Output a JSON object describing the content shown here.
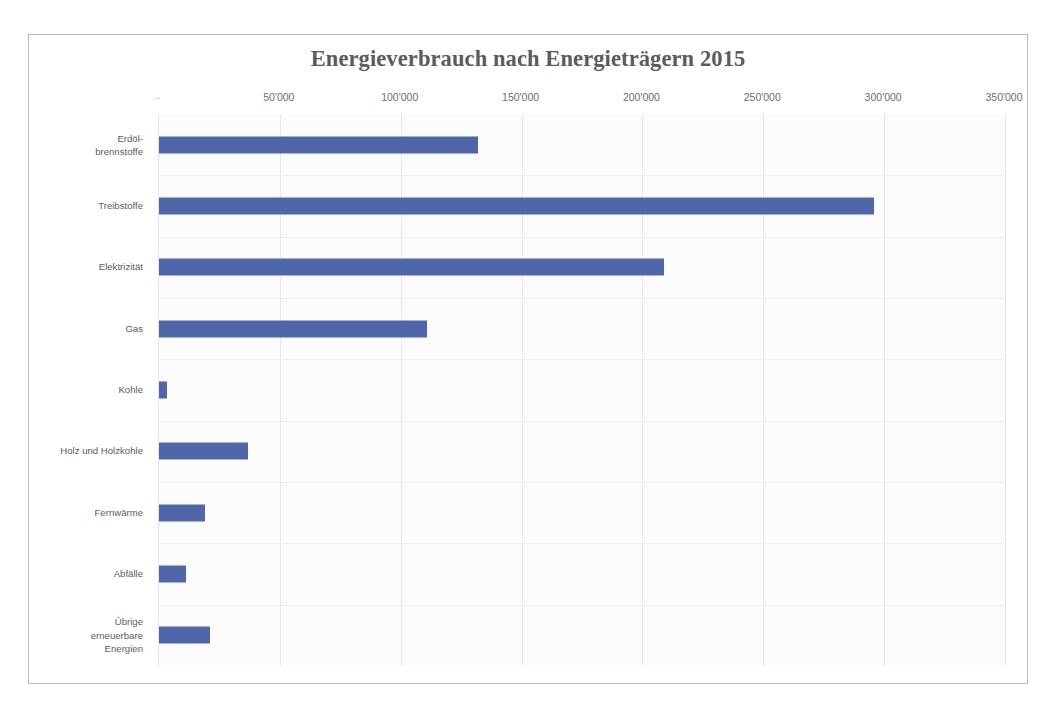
{
  "page": {
    "top_cut_text": "",
    "frame_border_color": "#b9b9b9"
  },
  "chart_data": {
    "type": "bar",
    "orientation": "horizontal",
    "title": "Energieverbrauch nach Energieträgern 2015",
    "xlabel": "",
    "ylabel": "",
    "xlim": [
      0,
      350000
    ],
    "xticks": [
      0,
      50000,
      100000,
      150000,
      200000,
      250000,
      300000,
      350000
    ],
    "xticklabels": [
      "-",
      "50'000",
      "100'000",
      "150'000",
      "200'000",
      "250'000",
      "300'000",
      "350'000"
    ],
    "grid": true,
    "legend": null,
    "bar_color": "#4f66a8",
    "title_color": "#5b5b5b",
    "label_color": "#5d5d5d",
    "gridline_color": "#e6e8ee",
    "plot_background": "#fcfcfd",
    "categories": [
      "Erdöl-\nbrennstoffe",
      "Treibstoffe",
      "Elektrizität",
      "Gas",
      "Kohle",
      "Holz und Holzkohle",
      "Fernwärme",
      "Abfälle",
      "Übrige\nerneuerbare\nEnergien"
    ],
    "values": [
      132000,
      296000,
      209000,
      111000,
      3500,
      37000,
      19000,
      11000,
      21000
    ],
    "points": [
      {
        "label": "Erdöl-brennstoffe",
        "label_lines": [
          "Erdöl-",
          "brennstoffe"
        ],
        "value": 132000
      },
      {
        "label": "Treibstoffe",
        "label_lines": [
          "Treibstoffe"
        ],
        "value": 296000
      },
      {
        "label": "Elektrizität",
        "label_lines": [
          "Elektrizität"
        ],
        "value": 209000
      },
      {
        "label": "Gas",
        "label_lines": [
          "Gas"
        ],
        "value": 111000
      },
      {
        "label": "Kohle",
        "label_lines": [
          "Kohle"
        ],
        "value": 3500
      },
      {
        "label": "Holz und Holzkohle",
        "label_lines": [
          "Holz und Holzkohle"
        ],
        "value": 37000
      },
      {
        "label": "Fernwärme",
        "label_lines": [
          "Fernwärme"
        ],
        "value": 19000
      },
      {
        "label": "Abfälle",
        "label_lines": [
          "Abfälle"
        ],
        "value": 11000
      },
      {
        "label": "Übrige erneuerbare Energien",
        "label_lines": [
          "Übrige",
          "erneuerbare",
          "Energien"
        ],
        "value": 21000
      }
    ]
  }
}
